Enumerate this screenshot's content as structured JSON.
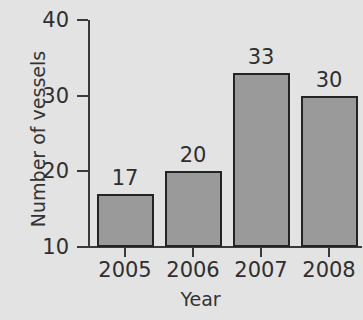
{
  "chart_data": {
    "type": "bar",
    "title": "",
    "subtitle": "",
    "xlabel": "Year",
    "ylabel": "Number of vessels",
    "categories": [
      "2005",
      "2006",
      "2007",
      "2008"
    ],
    "values": [
      17,
      20,
      33,
      30
    ],
    "value_labels": [
      "17",
      "20",
      "33",
      "30"
    ],
    "ylim": [
      10,
      40
    ],
    "yticks": [
      10,
      20,
      30,
      40
    ],
    "ytick_labels": [
      "10",
      "20",
      "30",
      "40"
    ],
    "grid": false,
    "legend": false,
    "legend_position": "none",
    "colors": {
      "background": "#e3e3e3",
      "bar_fill": "#9a9a9a",
      "bar_border": "#242424",
      "axis": "#3a3a3a",
      "text": "#2f2f2f"
    }
  }
}
